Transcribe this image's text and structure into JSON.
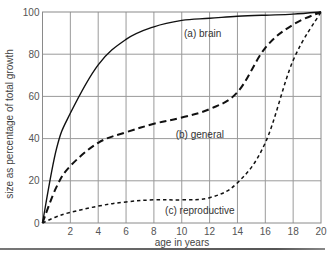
{
  "chart_data": {
    "type": "line",
    "title": "",
    "xlabel": "age in years",
    "ylabel": "size as percentage of total growth",
    "xlim": [
      0,
      20
    ],
    "ylim": [
      0,
      100
    ],
    "x_ticks": [
      2,
      4,
      6,
      8,
      10,
      12,
      14,
      16,
      18,
      20
    ],
    "y_ticks": [
      0,
      20,
      40,
      60,
      80,
      100
    ],
    "grid": true,
    "legend": "none (inline curve labels)",
    "x": [
      0,
      1,
      2,
      4,
      6,
      8,
      10,
      12,
      14,
      16,
      18,
      20
    ],
    "series": [
      {
        "name": "(a) brain",
        "style": "solid",
        "values": [
          0,
          35,
          52,
          75,
          87,
          93,
          96,
          97,
          98,
          98.5,
          99,
          100
        ]
      },
      {
        "name": "(b) general",
        "style": "dashed",
        "values": [
          0,
          17,
          27,
          38,
          43,
          47,
          50,
          54,
          62,
          83,
          94,
          100
        ]
      },
      {
        "name": "(c) reproductive",
        "style": "dotted-dash",
        "values": [
          0,
          3,
          5,
          8,
          10,
          11,
          11,
          12,
          19,
          38,
          77,
          100
        ]
      }
    ],
    "annotations": [
      {
        "text": "(a) brain",
        "x": 11.5,
        "y": 90
      },
      {
        "text": "(b) general",
        "x": 11.3,
        "y": 42
      },
      {
        "text": "(c) reproductive",
        "x": 11.3,
        "y": 6
      }
    ]
  }
}
